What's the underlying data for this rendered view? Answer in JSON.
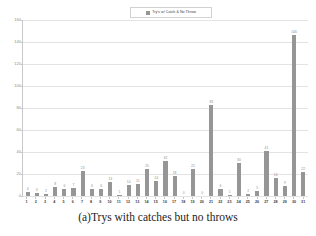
{
  "caption": "(a)Trys with catches but no throws",
  "legend": {
    "label": "Try's w/ Catch & No Throw",
    "swatch_color": "#969696",
    "position": "top-center"
  },
  "colors": {
    "bar": "#969696",
    "grid": "#e3e3e3",
    "axis": "#c8c8c8",
    "label_text": "#8f8f8f",
    "tick_text": "#3a3a3a"
  },
  "chart_data": {
    "type": "bar",
    "title": "",
    "xlabel": "",
    "ylabel": "",
    "ylim": [
      0,
      160
    ],
    "yticks": [
      0,
      20,
      40,
      60,
      80,
      100,
      120,
      140,
      160
    ],
    "grid": true,
    "legend_entries": [
      "Try's w/ Catch & No Throw"
    ],
    "categories": [
      "1",
      "2",
      "3",
      "4",
      "5",
      "6",
      "7",
      "8",
      "9",
      "10",
      "11",
      "12",
      "13",
      "14",
      "15",
      "16",
      "17",
      "18",
      "19",
      "20",
      "21",
      "22",
      "23",
      "24",
      "25",
      "26",
      "27",
      "28",
      "29",
      "30",
      "31"
    ],
    "values": [
      4,
      3,
      2,
      8,
      6,
      7,
      23,
      6,
      6,
      13,
      1,
      10,
      11,
      25,
      14,
      32,
      18,
      0,
      25,
      0,
      83,
      6,
      1,
      30,
      2,
      5,
      41,
      16,
      9,
      146,
      22
    ],
    "data_labels": [
      "4",
      "3",
      "2",
      "8",
      "6",
      "7",
      "23",
      "6",
      "6",
      "13",
      "1",
      "10",
      "11",
      "25",
      "14",
      "32",
      "18",
      "0",
      "25",
      "0",
      "83",
      "6",
      "1",
      "30",
      "2",
      "5",
      "41",
      "16",
      "9",
      "146",
      "22"
    ]
  }
}
